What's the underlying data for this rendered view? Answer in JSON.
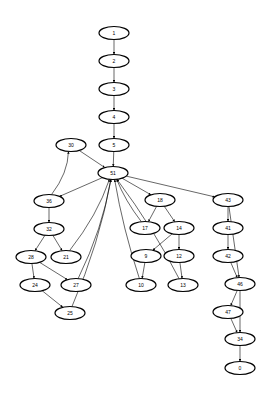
{
  "graph": {
    "nodes": [
      {
        "id": "1",
        "x": 114,
        "y": 33
      },
      {
        "id": "2",
        "x": 114,
        "y": 61
      },
      {
        "id": "3",
        "x": 114,
        "y": 89
      },
      {
        "id": "4",
        "x": 114,
        "y": 117
      },
      {
        "id": "5",
        "x": 114,
        "y": 145
      },
      {
        "id": "30",
        "x": 71,
        "y": 145
      },
      {
        "id": "51",
        "x": 113,
        "y": 173
      },
      {
        "id": "36",
        "x": 49,
        "y": 201
      },
      {
        "id": "32",
        "x": 49,
        "y": 229
      },
      {
        "id": "28",
        "x": 31,
        "y": 257
      },
      {
        "id": "21",
        "x": 66,
        "y": 257
      },
      {
        "id": "24",
        "x": 35,
        "y": 285
      },
      {
        "id": "27",
        "x": 76,
        "y": 285
      },
      {
        "id": "25",
        "x": 70,
        "y": 313
      },
      {
        "id": "18",
        "x": 160,
        "y": 200
      },
      {
        "id": "17",
        "x": 145,
        "y": 228
      },
      {
        "id": "14",
        "x": 179,
        "y": 228
      },
      {
        "id": "9",
        "x": 146,
        "y": 256
      },
      {
        "id": "12",
        "x": 179,
        "y": 256
      },
      {
        "id": "10",
        "x": 141,
        "y": 285
      },
      {
        "id": "13",
        "x": 183,
        "y": 285
      },
      {
        "id": "43",
        "x": 228,
        "y": 200
      },
      {
        "id": "41",
        "x": 228,
        "y": 228
      },
      {
        "id": "42",
        "x": 228,
        "y": 256
      },
      {
        "id": "46",
        "x": 240,
        "y": 284
      },
      {
        "id": "47",
        "x": 228,
        "y": 312
      },
      {
        "id": "34",
        "x": 240,
        "y": 339
      },
      {
        "id": "0",
        "x": 240,
        "y": 368
      }
    ],
    "edges": [
      [
        "1",
        "2"
      ],
      [
        "2",
        "3"
      ],
      [
        "3",
        "4"
      ],
      [
        "4",
        "5"
      ],
      [
        "5",
        "51"
      ],
      [
        "30",
        "51"
      ],
      [
        "51",
        "36"
      ],
      [
        "36",
        "30"
      ],
      [
        "36",
        "32"
      ],
      [
        "32",
        "28"
      ],
      [
        "32",
        "21"
      ],
      [
        "28",
        "24"
      ],
      [
        "28",
        "27"
      ],
      [
        "24",
        "25"
      ],
      [
        "21",
        "51"
      ],
      [
        "27",
        "51"
      ],
      [
        "25",
        "51"
      ],
      [
        "51",
        "18"
      ],
      [
        "18",
        "17"
      ],
      [
        "18",
        "14"
      ],
      [
        "14",
        "9"
      ],
      [
        "14",
        "12"
      ],
      [
        "9",
        "10"
      ],
      [
        "12",
        "13"
      ],
      [
        "17",
        "51"
      ],
      [
        "10",
        "51"
      ],
      [
        "13",
        "51"
      ],
      [
        "51",
        "43"
      ],
      [
        "43",
        "41"
      ],
      [
        "41",
        "42"
      ],
      [
        "42",
        "46"
      ],
      [
        "43",
        "46"
      ],
      [
        "46",
        "47"
      ],
      [
        "46",
        "34"
      ],
      [
        "47",
        "34"
      ],
      [
        "34",
        "0"
      ]
    ]
  }
}
